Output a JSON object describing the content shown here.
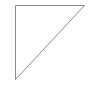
{
  "shape": {
    "type": "right-triangle",
    "vertices": [
      [
        15.5,
        5.5
      ],
      [
        84.5,
        5.5
      ],
      [
        15.5,
        79.5
      ]
    ],
    "stroke": "#8a8a8a",
    "fill": "#ffffff",
    "stroke_width": 1
  }
}
